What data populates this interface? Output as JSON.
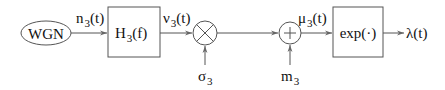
{
  "diagram": {
    "type": "signal-flow-block-diagram",
    "nodes": {
      "source": {
        "label": "WGN",
        "shape": "ellipse"
      },
      "filter": {
        "label": "H",
        "sub": "3",
        "arg": "(f)",
        "shape": "box"
      },
      "multiplier": {
        "symbol": "⊗",
        "shape": "circle"
      },
      "adder": {
        "symbol": "+",
        "shape": "circle"
      },
      "exp": {
        "label": "exp(·)",
        "shape": "box"
      },
      "output": {
        "label": "λ",
        "arg": "(t)"
      }
    },
    "signals": {
      "n": {
        "label": "n",
        "sub": "3",
        "arg": "(t)"
      },
      "nu": {
        "label": "ν",
        "sub": "3",
        "arg": "(t)"
      },
      "mu": {
        "label": "μ",
        "sub": "3",
        "arg": "(t)"
      },
      "sigma": {
        "label": "σ",
        "sub": "3"
      },
      "m": {
        "label": "m",
        "sub": "3"
      }
    },
    "edges": [
      {
        "from": "WGN",
        "to": "H3(f)",
        "signal": "n3(t)"
      },
      {
        "from": "H3(f)",
        "to": "multiplier",
        "signal": "ν3(t)"
      },
      {
        "from": "σ3",
        "to": "multiplier"
      },
      {
        "from": "multiplier",
        "to": "adder"
      },
      {
        "from": "m3",
        "to": "adder"
      },
      {
        "from": "adder",
        "to": "exp(·)",
        "signal": "μ3(t)"
      },
      {
        "from": "exp(·)",
        "to": "output",
        "signal": "λ(t)"
      }
    ]
  }
}
